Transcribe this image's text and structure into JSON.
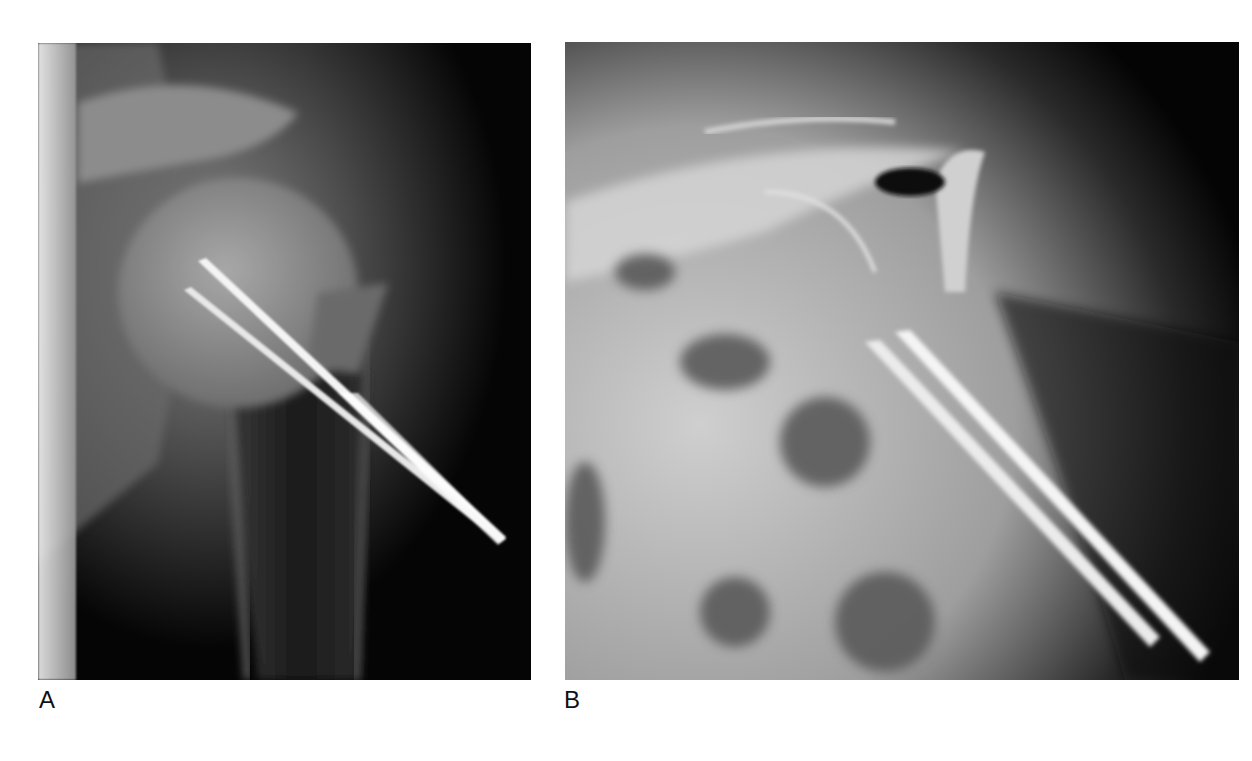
{
  "figure": {
    "panels": [
      {
        "id": "A",
        "label": "A",
        "description": "Radiograph of shoulder (AP view) showing humeral head with two parallel pins fixing proximal humerus",
        "background": "#000000"
      },
      {
        "id": "B",
        "label": "B",
        "description": "Radiograph (axial/scapular view) showing two parallel pins projecting through proximal humerus",
        "background": "#000000"
      }
    ]
  }
}
